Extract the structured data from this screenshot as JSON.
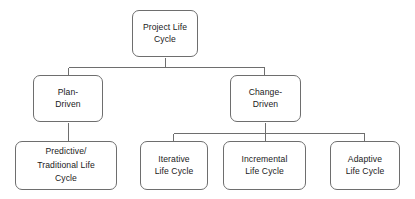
{
  "diagram": {
    "style": {
      "background": "#ffffff",
      "node_fill": "#ffffff",
      "node_border": "#6e6e6e",
      "connector_color": "#6e6e6e",
      "text_color": "#1a1a1a"
    },
    "nodes": {
      "root": {
        "label": "Project Life\nCycle"
      },
      "plan_driven": {
        "label": "Plan-\nDriven"
      },
      "change_driven": {
        "label": "Change-\nDriven"
      },
      "predictive": {
        "label": "Predictive/\nTraditional Life\nCycle"
      },
      "iterative": {
        "label": "Iterative\nLife Cycle"
      },
      "incremental": {
        "label": "Incremental\nLife Cycle"
      },
      "adaptive": {
        "label": "Adaptive\nLife Cycle"
      }
    },
    "edges": [
      {
        "from": "root",
        "to": "plan_driven"
      },
      {
        "from": "root",
        "to": "change_driven"
      },
      {
        "from": "plan_driven",
        "to": "predictive"
      },
      {
        "from": "change_driven",
        "to": "iterative"
      },
      {
        "from": "change_driven",
        "to": "incremental"
      },
      {
        "from": "change_driven",
        "to": "adaptive"
      }
    ]
  }
}
